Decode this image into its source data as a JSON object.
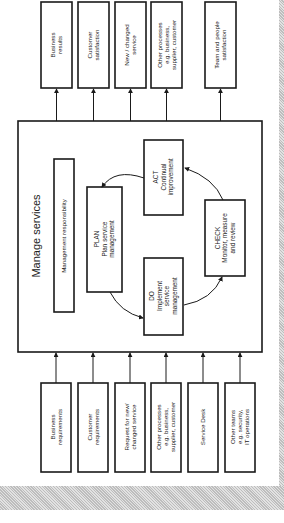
{
  "diagram": {
    "title": "Manage services",
    "management_box": "Management responsibility",
    "outputs": [
      {
        "lines": [
          "Business",
          "results"
        ]
      },
      {
        "lines": [
          "Customer",
          "satisfaction"
        ]
      },
      {
        "lines": [
          "New / changed",
          "service"
        ]
      },
      {
        "lines": [
          "Other processes",
          "e.g. business,",
          "supplier, customer"
        ]
      },
      {
        "lines": [
          "Team and people",
          "satisfaction"
        ]
      }
    ],
    "inputs": [
      {
        "lines": [
          "Business",
          "requirements"
        ]
      },
      {
        "lines": [
          "Customer",
          "requirements"
        ]
      },
      {
        "lines": [
          "Request for new/",
          "changed service"
        ]
      },
      {
        "lines": [
          "Other processes",
          "e.g. business,",
          "supplier, customer"
        ]
      },
      {
        "lines": [
          "Service Desk"
        ]
      },
      {
        "lines": [
          "Other teams",
          "e.g. security,",
          "IT operations"
        ]
      }
    ],
    "pdca": {
      "plan": {
        "lines": [
          "PLAN",
          "Plan service",
          "management"
        ]
      },
      "do": {
        "lines": [
          "DO",
          "Implement",
          "service",
          "management"
        ]
      },
      "check": {
        "lines": [
          "CHECK",
          "Monitor, measure",
          "and review"
        ]
      },
      "act": {
        "lines": [
          "ACT",
          "Continual",
          "improvement"
        ]
      }
    },
    "colors": {
      "line": "#1a1a1a",
      "background": "#ffffff",
      "border_hatch": "#cccccc"
    }
  }
}
